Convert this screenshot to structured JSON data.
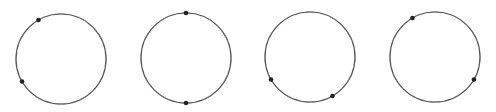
{
  "diagram": {
    "stroke_color": "#555555",
    "tick_color": "#777777",
    "dot_color": "#222222",
    "tick_count": 12,
    "radius": 45,
    "circles": [
      {
        "id": "circle-1",
        "cx": 61,
        "cy": 59,
        "dots_deg": [
          120,
          210
        ]
      },
      {
        "id": "circle-2",
        "cx": 186,
        "cy": 58,
        "dots_deg": [
          90,
          270
        ]
      },
      {
        "id": "circle-3",
        "cx": 310,
        "cy": 57,
        "dots_deg": [
          210,
          300
        ]
      },
      {
        "id": "circle-4",
        "cx": 435,
        "cy": 57,
        "dots_deg": [
          120,
          330
        ]
      }
    ]
  }
}
